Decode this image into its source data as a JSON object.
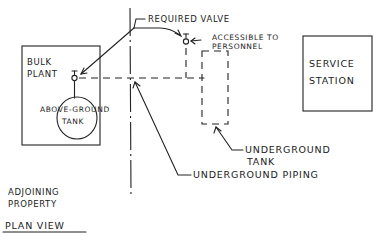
{
  "diagram": {
    "title": "PLAN VIEW",
    "regions": {
      "adjoining_property": [
        "ADJOINING",
        "PROPERTY"
      ],
      "bulk_plant": [
        "BULK",
        "PLANT"
      ],
      "service_station": [
        "SERVICE",
        "STATION"
      ]
    },
    "components": {
      "above_ground_tank": [
        "ABOVE-GROUND",
        "TANK"
      ],
      "underground_tank": [
        "UNDERGROUND",
        "TANK"
      ],
      "underground_piping": "UNDERGROUND PIPING"
    },
    "annotations": {
      "required_valve": "REQUIRED VALVE",
      "accessible": [
        "ACCESSIBLE TO",
        "PERSONNEL"
      ]
    },
    "colors": {
      "ink": "#222222",
      "paper": "#ffffff"
    }
  }
}
